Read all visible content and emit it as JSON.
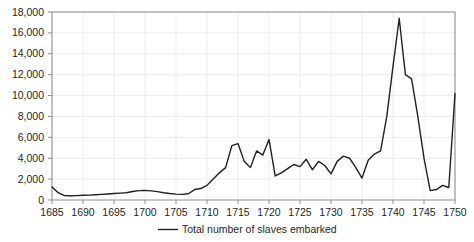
{
  "chart_data": {
    "type": "line",
    "title": "",
    "xlabel": "",
    "ylabel": "",
    "xlim": [
      1685,
      1750
    ],
    "ylim": [
      0,
      18000
    ],
    "grid": true,
    "legend_position": "bottom-center",
    "y_ticks": [
      0,
      2000,
      4000,
      6000,
      8000,
      10000,
      12000,
      14000,
      16000,
      18000
    ],
    "y_tick_labels": [
      "0",
      "2,000",
      "4,000",
      "6,000",
      "8,000",
      "10,000",
      "12,000",
      "14,000",
      "16,000",
      "18,000"
    ],
    "x_ticks": [
      1685,
      1690,
      1695,
      1700,
      1705,
      1710,
      1715,
      1720,
      1725,
      1730,
      1735,
      1740,
      1745,
      1750
    ],
    "x_tick_labels": [
      "1685",
      "1690",
      "1695",
      "1700",
      "1705",
      "1710",
      "1715",
      "1720",
      "1725",
      "1730",
      "1735",
      "1740",
      "1745",
      "1750"
    ],
    "series": [
      {
        "name": "Total number of slaves embarked",
        "color": "#231f20",
        "x": [
          1685,
          1686,
          1687,
          1688,
          1689,
          1690,
          1691,
          1692,
          1693,
          1694,
          1695,
          1696,
          1697,
          1698,
          1699,
          1700,
          1701,
          1702,
          1703,
          1704,
          1705,
          1706,
          1707,
          1708,
          1709,
          1710,
          1711,
          1712,
          1713,
          1714,
          1715,
          1716,
          1717,
          1718,
          1719,
          1720,
          1721,
          1722,
          1723,
          1724,
          1725,
          1726,
          1727,
          1728,
          1729,
          1730,
          1731,
          1732,
          1733,
          1734,
          1735,
          1736,
          1737,
          1738,
          1739,
          1740,
          1741,
          1742,
          1743,
          1744,
          1745,
          1746,
          1747,
          1748,
          1749,
          1750
        ],
        "y": [
          1250,
          700,
          420,
          400,
          420,
          450,
          470,
          500,
          540,
          580,
          620,
          660,
          700,
          820,
          900,
          920,
          870,
          800,
          700,
          620,
          560,
          540,
          600,
          1000,
          1100,
          1400,
          2000,
          2600,
          3100,
          5200,
          5400,
          3700,
          3100,
          4700,
          4300,
          5800,
          2300,
          2600,
          3000,
          3400,
          3200,
          3900,
          2900,
          3700,
          3300,
          2500,
          3700,
          4200,
          4000,
          3100,
          2100,
          3800,
          4400,
          4700,
          8000,
          12800,
          17400,
          12000,
          11600,
          8000,
          4000,
          900,
          1000,
          1400,
          1200,
          10200
        ]
      }
    ]
  },
  "legend": {
    "label": "Total number of slaves embarked"
  }
}
